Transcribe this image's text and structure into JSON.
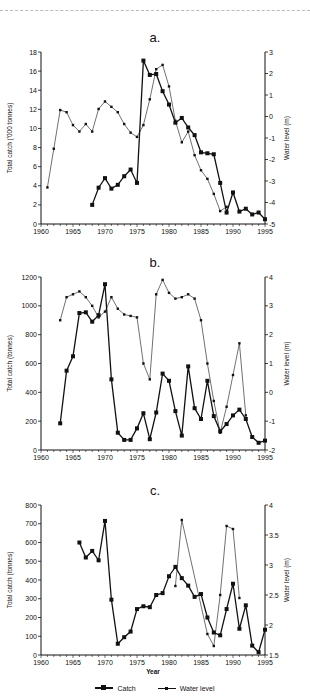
{
  "legend": {
    "catch_label": "Catch",
    "water_label": "Water level"
  },
  "shared_xlabel": "Year",
  "chart_data": [
    {
      "type": "line",
      "title": "a.",
      "xlabel": "",
      "ylabel": "Total catch ('000 tonnes)",
      "y2label": "Water level (m)",
      "xlim": [
        1960,
        1995
      ],
      "ylim": [
        0,
        18
      ],
      "y2lim": [
        -5,
        3
      ],
      "xticks": [
        1960,
        1965,
        1970,
        1975,
        1980,
        1985,
        1990,
        1995
      ],
      "yticks": [
        0,
        2,
        4,
        6,
        8,
        10,
        12,
        14,
        16,
        18
      ],
      "y2ticks": [
        -5,
        -4,
        -3,
        -2,
        -1,
        0,
        1,
        2,
        3
      ],
      "grid": false,
      "series": [
        {
          "name": "Catch",
          "axis": "left",
          "x": [
            1968,
            1969,
            1970,
            1971,
            1972,
            1973,
            1974,
            1975,
            1976,
            1977,
            1978,
            1979,
            1980,
            1981,
            1982,
            1983,
            1984,
            1985,
            1986,
            1987,
            1988,
            1989,
            1990,
            1991,
            1992,
            1993,
            1994,
            1995
          ],
          "values": [
            2.0,
            3.8,
            4.8,
            3.7,
            4.1,
            5.0,
            5.7,
            4.3,
            17.1,
            15.6,
            15.7,
            13.9,
            12.5,
            10.6,
            11.1,
            10.1,
            9.3,
            7.5,
            7.4,
            7.3,
            4.3,
            1.2,
            3.3,
            1.3,
            1.6,
            1.0,
            1.2,
            0.5
          ]
        },
        {
          "name": "Water level",
          "axis": "right",
          "x": [
            1961,
            1962,
            1963,
            1964,
            1965,
            1966,
            1967,
            1968,
            1969,
            1970,
            1971,
            1972,
            1973,
            1974,
            1975,
            1976,
            1977,
            1978,
            1979,
            1980,
            1981,
            1982,
            1983,
            1984,
            1985,
            1986,
            1987,
            1988,
            1989
          ],
          "values": [
            -3.3,
            -1.5,
            0.3,
            0.2,
            -0.4,
            -0.7,
            -0.35,
            -0.7,
            0.35,
            0.7,
            0.45,
            0.2,
            -0.35,
            -0.75,
            -0.95,
            -0.4,
            0.8,
            2.2,
            2.4,
            1.4,
            -0.2,
            -1.2,
            -0.7,
            -1.8,
            -2.5,
            -2.9,
            -3.6,
            -4.4,
            -4.2
          ]
        }
      ]
    },
    {
      "type": "line",
      "title": "b.",
      "xlabel": "",
      "ylabel": "Total catch (tonnes)",
      "y2label": "Water level (m)",
      "xlim": [
        1960,
        1995
      ],
      "ylim": [
        0,
        1200
      ],
      "y2lim": [
        -2,
        4
      ],
      "xticks": [
        1960,
        1965,
        1970,
        1975,
        1980,
        1985,
        1990,
        1995
      ],
      "yticks": [
        0,
        200,
        400,
        600,
        800,
        1000,
        1200
      ],
      "y2ticks": [
        -2,
        -1,
        0,
        1,
        2,
        3,
        4
      ],
      "grid": false,
      "series": [
        {
          "name": "Catch",
          "axis": "left",
          "x": [
            1963,
            1964,
            1965,
            1966,
            1967,
            1968,
            1969,
            1970,
            1971,
            1972,
            1973,
            1974,
            1975,
            1976,
            1977,
            1978,
            1979,
            1980,
            1981,
            1982,
            1983,
            1984,
            1985,
            1986,
            1987,
            1988,
            1989,
            1990,
            1991,
            1992,
            1993,
            1994,
            1995
          ],
          "values": [
            185,
            550,
            650,
            950,
            955,
            890,
            935,
            1150,
            490,
            120,
            70,
            70,
            150,
            255,
            75,
            260,
            530,
            480,
            270,
            100,
            580,
            290,
            215,
            480,
            235,
            130,
            180,
            240,
            280,
            215,
            90,
            50,
            65
          ]
        },
        {
          "name": "Water level",
          "axis": "right",
          "x": [
            1963,
            1964,
            1965,
            1966,
            1967,
            1968,
            1969,
            1970,
            1971,
            1972,
            1973,
            1974,
            1975,
            1976,
            1977,
            1978,
            1979,
            1980,
            1981,
            1982,
            1983,
            1984,
            1985,
            1986,
            1987,
            1988,
            1989,
            1990,
            1991,
            1992
          ],
          "values": [
            2.5,
            3.3,
            3.4,
            3.5,
            3.3,
            3.0,
            2.6,
            2.8,
            3.3,
            2.9,
            2.7,
            2.65,
            2.6,
            1.0,
            0.45,
            3.4,
            3.9,
            3.45,
            3.25,
            3.3,
            3.4,
            3.25,
            2.5,
            1.0,
            -0.3,
            -1.4,
            -0.5,
            0.6,
            1.7,
            -0.8
          ]
        }
      ]
    },
    {
      "type": "line",
      "title": "c.",
      "xlabel": "Year",
      "ylabel": "Total catch (tonnes)",
      "y2label": "Water level (m)",
      "xlim": [
        1960,
        1995
      ],
      "ylim": [
        0,
        800
      ],
      "y2lim": [
        1.5,
        4
      ],
      "xticks": [
        1960,
        1965,
        1970,
        1975,
        1980,
        1985,
        1990,
        1995
      ],
      "yticks": [
        0,
        100,
        200,
        300,
        400,
        500,
        600,
        700,
        800
      ],
      "y2ticks": [
        1.5,
        2,
        2.5,
        3,
        3.5,
        4
      ],
      "grid": false,
      "series": [
        {
          "name": "Catch",
          "axis": "left",
          "x": [
            1966,
            1967,
            1968,
            1969,
            1970,
            1971,
            1972,
            1973,
            1974,
            1975,
            1976,
            1977,
            1978,
            1979,
            1980,
            1981,
            1982,
            1983,
            1984,
            1985,
            1986,
            1987,
            1988,
            1989,
            1990,
            1991,
            1992,
            1993,
            1994,
            1995
          ],
          "values": [
            600,
            520,
            555,
            505,
            715,
            295,
            60,
            95,
            125,
            245,
            260,
            255,
            320,
            330,
            420,
            470,
            410,
            370,
            310,
            325,
            200,
            120,
            105,
            245,
            380,
            140,
            265,
            50,
            15,
            135
          ]
        },
        {
          "name": "Water level",
          "axis": "right",
          "x": [
            1981,
            1982,
            1986,
            1987,
            1988,
            1989,
            1990,
            1991
          ],
          "values": [
            2.65,
            3.75,
            1.85,
            1.65,
            2.5,
            3.65,
            3.6,
            2.45
          ]
        }
      ]
    }
  ]
}
